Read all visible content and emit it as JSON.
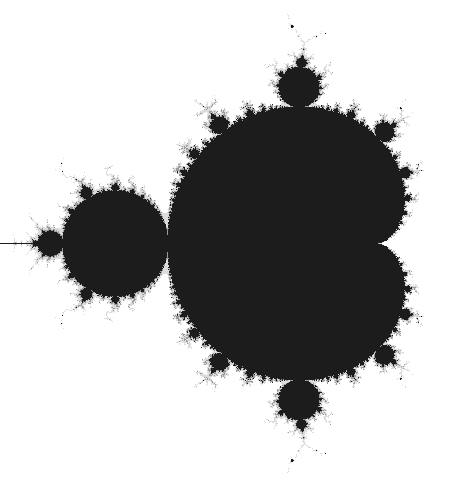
{
  "image": {
    "subject": "Mandelbrot set",
    "width": 456,
    "height": 483,
    "background_color": "#ffffff",
    "set_color": "#1c1c1c",
    "edge_color": "#9a9a9a"
  },
  "view": {
    "origin_px": [
      325,
      243
    ],
    "scale_px_per_unit": 210,
    "max_iterations": 120
  }
}
